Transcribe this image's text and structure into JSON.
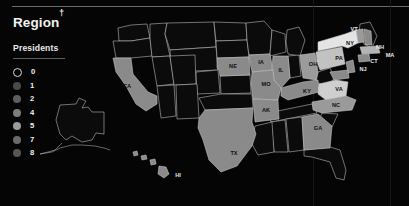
{
  "panel": {
    "title": "Region",
    "title_dagger": "†",
    "subtitle": "Presidents"
  },
  "colors": {
    "background": "#050505",
    "state_stroke": "#c9c9c9",
    "rule": "#6d6d6d",
    "text": "#f2f2f2"
  },
  "legend": {
    "items": [
      {
        "label": "0",
        "value": 0,
        "color": "none",
        "hollow": true
      },
      {
        "label": "1",
        "value": 1,
        "color": "#4a4a4a",
        "hollow": false
      },
      {
        "label": "2",
        "value": 2,
        "color": "#5e5e5e",
        "hollow": false
      },
      {
        "label": "4",
        "value": 4,
        "color": "#7d7d7d",
        "hollow": false
      },
      {
        "label": "5",
        "value": 5,
        "color": "#9a9a9a",
        "hollow": false
      },
      {
        "label": "7",
        "value": 7,
        "color": "#6a6a6a",
        "hollow": false
      },
      {
        "label": "8",
        "value": 8,
        "color": "#565656",
        "hollow": false
      }
    ]
  },
  "chart_data": {
    "type": "map",
    "title": "Region†",
    "legend_title": "Presidents",
    "legend_position": "left",
    "scale": "sequential-grayscale",
    "value_label": "Presidents born in state",
    "domain": [
      0,
      8
    ],
    "labeled_states": [
      "CA",
      "NE",
      "IA",
      "IL",
      "MO",
      "AK",
      "TX",
      "OH",
      "PA",
      "NY",
      "VT",
      "NH",
      "MA",
      "CT",
      "NJ",
      "KY",
      "VA",
      "NC",
      "GA",
      "HI"
    ],
    "states": [
      {
        "code": "WA",
        "value": 0,
        "fill": "#0b0b0b",
        "labeled": false
      },
      {
        "code": "OR",
        "value": 0,
        "fill": "#0b0b0b",
        "labeled": false
      },
      {
        "code": "ID",
        "value": 0,
        "fill": "#0b0b0b",
        "labeled": false
      },
      {
        "code": "MT",
        "value": 0,
        "fill": "#0b0b0b",
        "labeled": false
      },
      {
        "code": "WY",
        "value": 0,
        "fill": "#0b0b0b",
        "labeled": false
      },
      {
        "code": "ND",
        "value": 0,
        "fill": "#0b0b0b",
        "labeled": false
      },
      {
        "code": "SD",
        "value": 0,
        "fill": "#0b0b0b",
        "labeled": false
      },
      {
        "code": "MN",
        "value": 0,
        "fill": "#0b0b0b",
        "labeled": false
      },
      {
        "code": "WI",
        "value": 0,
        "fill": "#0b0b0b",
        "labeled": false
      },
      {
        "code": "MI",
        "value": 0,
        "fill": "#0b0b0b",
        "labeled": false
      },
      {
        "code": "NV",
        "value": 0,
        "fill": "#0b0b0b",
        "labeled": false
      },
      {
        "code": "UT",
        "value": 0,
        "fill": "#0b0b0b",
        "labeled": false
      },
      {
        "code": "CO",
        "value": 0,
        "fill": "#0b0b0b",
        "labeled": false
      },
      {
        "code": "AZ",
        "value": 0,
        "fill": "#0b0b0b",
        "labeled": false
      },
      {
        "code": "NM",
        "value": 0,
        "fill": "#0b0b0b",
        "labeled": false
      },
      {
        "code": "KS",
        "value": 0,
        "fill": "#0b0b0b",
        "labeled": false
      },
      {
        "code": "OK",
        "value": 0,
        "fill": "#0b0b0b",
        "labeled": false
      },
      {
        "code": "LA",
        "value": 0,
        "fill": "#0b0b0b",
        "labeled": false
      },
      {
        "code": "MS",
        "value": 0,
        "fill": "#0b0b0b",
        "labeled": false
      },
      {
        "code": "AL",
        "value": 0,
        "fill": "#0b0b0b",
        "labeled": false
      },
      {
        "code": "TN",
        "value": 0,
        "fill": "#0b0b0b",
        "labeled": false
      },
      {
        "code": "SC",
        "value": 0,
        "fill": "#0b0b0b",
        "labeled": false
      },
      {
        "code": "FL",
        "value": 0,
        "fill": "#0b0b0b",
        "labeled": false
      },
      {
        "code": "WV",
        "value": 0,
        "fill": "#0b0b0b",
        "labeled": false
      },
      {
        "code": "IN",
        "value": 0,
        "fill": "#0b0b0b",
        "labeled": false
      },
      {
        "code": "ME",
        "value": 0,
        "fill": "#0b0b0b",
        "labeled": false
      },
      {
        "code": "AK",
        "value": 0,
        "fill": "#0b0b0b",
        "labeled": false
      },
      {
        "code": "CA",
        "value": 2,
        "fill": "#8a8a8a",
        "labeled": true
      },
      {
        "code": "NE",
        "value": 1,
        "fill": "#8a8a8a",
        "labeled": true
      },
      {
        "code": "IA",
        "value": 1,
        "fill": "#8a8a8a",
        "labeled": true
      },
      {
        "code": "IL",
        "value": 2,
        "fill": "#8a8a8a",
        "labeled": true
      },
      {
        "code": "MO",
        "value": 1,
        "fill": "#8a8a8a",
        "labeled": true
      },
      {
        "code": "ARK",
        "value": 1,
        "fill": "#8a8a8a",
        "labeled": true
      },
      {
        "code": "TX",
        "value": 2,
        "fill": "#8a8a8a",
        "labeled": true
      },
      {
        "code": "OH",
        "value": 7,
        "fill": "#9b9b9b",
        "labeled": true
      },
      {
        "code": "PA",
        "value": 2,
        "fill": "#c2c2c2",
        "labeled": true
      },
      {
        "code": "NY",
        "value": 5,
        "fill": "#e4e4e4",
        "labeled": true
      },
      {
        "code": "VT",
        "value": 2,
        "fill": "#9a9a9a",
        "labeled": true
      },
      {
        "code": "NH",
        "value": 1,
        "fill": "#8a8a8a",
        "labeled": true
      },
      {
        "code": "MA",
        "value": 4,
        "fill": "#b4b4b4",
        "labeled": true
      },
      {
        "code": "CT",
        "value": 1,
        "fill": "#8a8a8a",
        "labeled": true
      },
      {
        "code": "NJ",
        "value": 1,
        "fill": "#8a8a8a",
        "labeled": true
      },
      {
        "code": "KY",
        "value": 1,
        "fill": "#8a8a8a",
        "labeled": true
      },
      {
        "code": "VA",
        "value": 8,
        "fill": "#cfcfcf",
        "labeled": true
      },
      {
        "code": "NC",
        "value": 2,
        "fill": "#9a9a9a",
        "labeled": true
      },
      {
        "code": "GA",
        "value": 1,
        "fill": "#8a8a8a",
        "labeled": true
      },
      {
        "code": "HI",
        "value": 1,
        "fill": "#8a8a8a",
        "labeled": true
      }
    ]
  }
}
